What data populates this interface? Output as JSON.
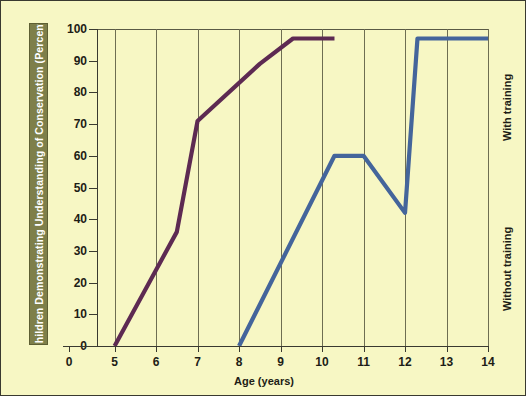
{
  "chart_data": {
    "type": "line",
    "title": "",
    "xlabel": "Age (years)",
    "ylabel": "Children Demonstrating Understanding of Conservation (Percent)",
    "xlim": [
      4.6,
      14.0
    ],
    "ylim": [
      0,
      100
    ],
    "x_ticks": [
      0,
      5,
      6,
      7,
      8,
      9,
      10,
      11,
      12,
      13,
      14
    ],
    "x_tick_labels": [
      "0",
      "5",
      "6",
      "7",
      "8",
      "9",
      "10",
      "11",
      "12",
      "13",
      "14"
    ],
    "y_ticks": [
      0,
      10,
      20,
      30,
      40,
      50,
      60,
      70,
      80,
      90,
      100
    ],
    "y_tick_labels": [
      "0",
      "10",
      "20",
      "30",
      "40",
      "50",
      "60",
      "70",
      "80",
      "90",
      "100"
    ],
    "axis_break_after_first_xtick": true,
    "grid": "vertical",
    "legend_position": "right-inline-rotated",
    "series": [
      {
        "name": "With training",
        "color": "#5d2a52",
        "points": [
          {
            "x": 5.0,
            "y": 0
          },
          {
            "x": 6.5,
            "y": 36
          },
          {
            "x": 7.0,
            "y": 71
          },
          {
            "x": 8.5,
            "y": 89
          },
          {
            "x": 9.3,
            "y": 97
          },
          {
            "x": 10.3,
            "y": 97
          }
        ]
      },
      {
        "name": "Without training",
        "color": "#44659b",
        "points": [
          {
            "x": 8.0,
            "y": 0
          },
          {
            "x": 10.3,
            "y": 60
          },
          {
            "x": 11.0,
            "y": 60
          },
          {
            "x": 12.0,
            "y": 42
          },
          {
            "x": 12.3,
            "y": 97
          },
          {
            "x": 14.0,
            "y": 97
          }
        ]
      }
    ],
    "annotations": [
      {
        "text": "With training",
        "orientation": "vertical"
      },
      {
        "text": "Without training",
        "orientation": "vertical"
      }
    ]
  },
  "figure": {
    "background_color": "#f7f7c4",
    "ylabel_band_color": "#7e7f4a",
    "ylabel_text_color": "#ffffff",
    "axis_color": "#3a3a30",
    "gridline_color": "#6e6e52"
  }
}
